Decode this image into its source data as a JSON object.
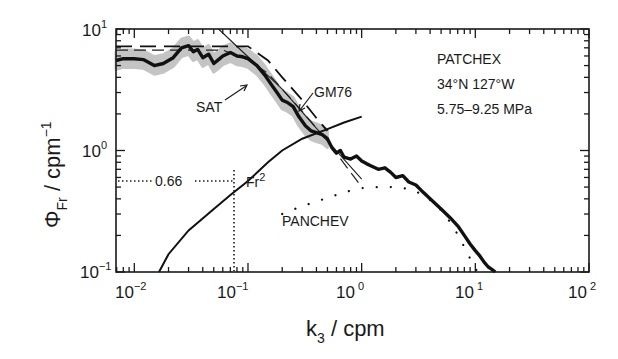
{
  "chart_data": {
    "type": "line",
    "title": "",
    "xlabel": "k_3 / cpm",
    "ylabel": "Φ_Fr / cpm^-1",
    "xscale": "log",
    "yscale": "log",
    "xlim": [
      0.0069,
      100
    ],
    "ylim": [
      0.1,
      10
    ],
    "x_tick_labels": [
      "10^-2",
      "10^-1",
      "10^0",
      "10^1",
      "10^2"
    ],
    "y_tick_labels": [
      "10^-1",
      "10^0",
      "10^1"
    ],
    "grid": false,
    "annotations": {
      "info_lines": [
        "PATCHEX",
        "34°N 127°W",
        "5.75–9.25 MPa"
      ],
      "hline_value_label": "0.66",
      "hline_y": 0.56,
      "vline_x": 0.1,
      "fr2_label": "Fr²",
      "sat_label": "SAT",
      "gm76_label": "GM76",
      "panchev_label": "PANCHEV"
    },
    "series": [
      {
        "name": "Observed spectrum",
        "style": "thick-solid",
        "x": [
          0.0069,
          0.008,
          0.01,
          0.012,
          0.015,
          0.018,
          0.022,
          0.026,
          0.03,
          0.033,
          0.036,
          0.04,
          0.045,
          0.05,
          0.055,
          0.06,
          0.07,
          0.08,
          0.09,
          0.1,
          0.12,
          0.14,
          0.16,
          0.18,
          0.2,
          0.22,
          0.25,
          0.28,
          0.32,
          0.36,
          0.4,
          0.45,
          0.5,
          0.55,
          0.6,
          0.65,
          0.7,
          0.8,
          0.9,
          1.0,
          1.1,
          1.2,
          1.4,
          1.6,
          1.8,
          2.0,
          2.3,
          2.6,
          3.0,
          3.5,
          4.0,
          5.0,
          6.0,
          7.0,
          8.0,
          9.0,
          10,
          11,
          12,
          13,
          14,
          15
        ],
        "values": [
          5.5,
          5.7,
          5.7,
          5.6,
          5.0,
          5.2,
          5.8,
          7.0,
          7.3,
          6.5,
          6.8,
          5.8,
          6.2,
          5.2,
          5.6,
          6.0,
          6.4,
          6.0,
          5.9,
          5.7,
          5.0,
          4.2,
          3.5,
          3.0,
          2.6,
          2.5,
          2.3,
          1.9,
          1.6,
          1.45,
          1.4,
          1.35,
          1.25,
          1.05,
          0.95,
          1.0,
          0.88,
          0.85,
          0.9,
          0.82,
          0.78,
          0.75,
          0.7,
          0.72,
          0.66,
          0.6,
          0.62,
          0.55,
          0.52,
          0.45,
          0.4,
          0.33,
          0.28,
          0.24,
          0.2,
          0.17,
          0.15,
          0.135,
          0.12,
          0.11,
          0.105,
          0.1
        ]
      },
      {
        "name": "Observed spectrum confidence band",
        "style": "gray-band",
        "halfwidth_factor": 1.18
      },
      {
        "name": "GM76",
        "style": "long-dash",
        "x": [
          0.0069,
          0.1,
          0.15,
          0.2,
          0.3,
          0.4,
          0.5
        ],
        "values": [
          7.2,
          7.2,
          5.5,
          4.0,
          2.6,
          1.85,
          1.45
        ]
      },
      {
        "name": "SAT",
        "style": "dashed-thin",
        "x": [
          0.0069,
          0.06,
          0.1,
          0.15,
          0.2,
          0.3,
          0.5,
          0.7,
          1.0
        ],
        "values": [
          6.7,
          6.7,
          5.6,
          4.3,
          3.2,
          2.1,
          1.2,
          0.78,
          0.5
        ]
      },
      {
        "name": "k^-1 reference line",
        "style": "thin-solid",
        "x": [
          0.055,
          0.2,
          0.5,
          1.0
        ],
        "values": [
          10,
          3.2,
          1.2,
          0.58
        ]
      },
      {
        "name": "Fr2",
        "style": "solid",
        "x": [
          0.0165,
          0.02,
          0.03,
          0.05,
          0.07,
          0.1,
          0.15,
          0.2,
          0.3,
          0.5,
          0.7,
          1.0
        ],
        "values": [
          0.1,
          0.14,
          0.22,
          0.33,
          0.43,
          0.56,
          0.8,
          1.0,
          1.25,
          1.5,
          1.7,
          1.9
        ]
      },
      {
        "name": "PANCHEV",
        "style": "dotted",
        "x": [
          0.2,
          0.28,
          0.4,
          0.55,
          0.75,
          1.0,
          1.4,
          2.0,
          2.7,
          3.5,
          4.5,
          5.5,
          6.5,
          7.5,
          8.5,
          9.5,
          10.5
        ],
        "values": [
          0.3,
          0.34,
          0.38,
          0.42,
          0.46,
          0.49,
          0.5,
          0.5,
          0.48,
          0.43,
          0.36,
          0.29,
          0.23,
          0.18,
          0.145,
          0.115,
          0.1
        ]
      }
    ]
  },
  "axes": {
    "x_label_main": "k",
    "x_label_sub": "3",
    "x_label_rest": " / cpm",
    "y_label_main": "Φ",
    "y_label_sub": "Fr",
    "y_label_rest": " / cpm",
    "y_label_sup": "−1",
    "x_ticks": [
      {
        "base": "10",
        "exp": "−2"
      },
      {
        "base": "10",
        "exp": "−1"
      },
      {
        "base": "10",
        "exp": "0"
      },
      {
        "base": "10",
        "exp": "1"
      },
      {
        "base": "10",
        "exp": "2"
      }
    ],
    "y_ticks": [
      {
        "base": "10",
        "exp": "−1"
      },
      {
        "base": "10",
        "exp": "0"
      },
      {
        "base": "10",
        "exp": "1"
      }
    ]
  },
  "info": {
    "line1": "PATCHEX",
    "line2": "34°N 127°W",
    "line3": "5.75–9.25 MPa"
  },
  "labels": {
    "sat": "SAT",
    "gm76": "GM76",
    "panchev": "PANCHEV",
    "fr": "Fr",
    "fr_sup": "2",
    "hline_value": "0.66"
  }
}
